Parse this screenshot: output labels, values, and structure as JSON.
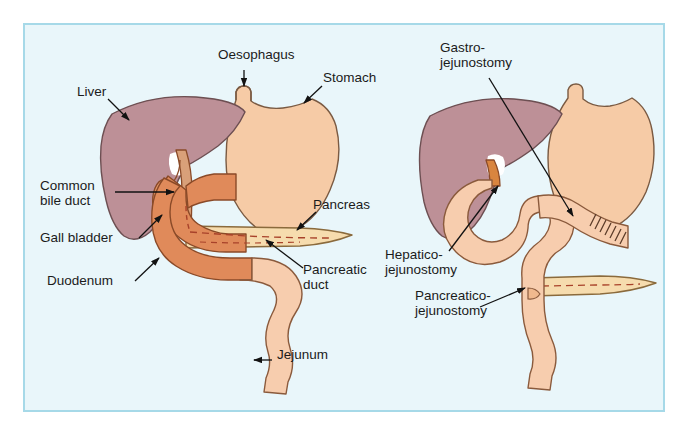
{
  "figure": {
    "kind": "medical-anatomy-diagram",
    "panels": [
      {
        "id": "normal-anatomy",
        "side": "left"
      },
      {
        "id": "post-whipple-reconstruction",
        "side": "right"
      }
    ]
  },
  "colors": {
    "frame_border": "#a6d9e8",
    "frame_background": "#e9f6fa",
    "page_background": "#ffffff",
    "liver": "#bd9097",
    "liver_outline": "#6d4f52",
    "stomach": "#f6cba6",
    "stomach_outline": "#7a5a42",
    "duodenum": "#e08a5a",
    "duodenum_outline": "#8a4a28",
    "jejunum": "#f7cdae",
    "jejunum_outline": "#8a5a3c",
    "pancreas": "#f6dcae",
    "pancreas_outline": "#8a6a3c",
    "gallbladder": "#e69a6a",
    "bile_duct": "#d9a079",
    "duct_dashes": "#a8422a",
    "label_text": "#1b1b1b",
    "leader_line": "#121212"
  },
  "labels_left": [
    {
      "name": "liver",
      "text": "Liver",
      "x": 77,
      "y": 92,
      "align": "left"
    },
    {
      "name": "oesophagus",
      "text": "Oesophagus",
      "x": 220,
      "y": 55,
      "align": "left"
    },
    {
      "name": "stomach",
      "text": "Stomach",
      "x": 323,
      "y": 78,
      "align": "left"
    },
    {
      "name": "common-bile-duct",
      "text": "Common\nbile duct",
      "x": 40,
      "y": 186,
      "align": "left"
    },
    {
      "name": "gall-bladder",
      "text": "Gall bladder",
      "x": 40,
      "y": 238,
      "align": "left"
    },
    {
      "name": "duodenum",
      "text": "Duodenum",
      "x": 47,
      "y": 281,
      "align": "left"
    },
    {
      "name": "pancreas",
      "text": "Pancreas",
      "x": 313,
      "y": 205,
      "align": "left"
    },
    {
      "name": "pancreatic-duct",
      "text": "Pancreatic\nduct",
      "x": 303,
      "y": 270,
      "align": "left"
    },
    {
      "name": "jejunum",
      "text": "Jejunum",
      "x": 274,
      "y": 355,
      "align": "left"
    }
  ],
  "labels_right": [
    {
      "name": "gastro-jejunostomy",
      "text": "Gastro-\njejunostomy",
      "x": 440,
      "y": 48,
      "align": "left"
    },
    {
      "name": "hepatico-jejunostomy",
      "text": "Hepatico-\njejunostomy",
      "x": 385,
      "y": 255,
      "align": "left"
    },
    {
      "name": "pancreatico-jejunostomy",
      "text": "Pancreatico-\njejunostomy",
      "x": 415,
      "y": 296,
      "align": "left"
    }
  ],
  "structures_left": [
    "liver",
    "stomach",
    "oesophagus",
    "gall bladder",
    "common bile duct",
    "duodenum",
    "pancreas",
    "pancreatic duct",
    "jejunum"
  ],
  "structures_right": [
    "liver",
    "stomach",
    "oesophagus",
    "pancreas remnant",
    "roux jejunal limb",
    "gastro-jejunostomy anastomosis",
    "hepatico-jejunostomy anastomosis",
    "pancreatico-jejunostomy anastomosis"
  ]
}
